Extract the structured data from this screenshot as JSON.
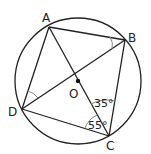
{
  "diagram": {
    "circle": {
      "cx": 78,
      "cy": 81,
      "r": 63
    },
    "points": {
      "A": {
        "label": "A",
        "x": 49,
        "y": 27
      },
      "B": {
        "label": "B",
        "x": 125,
        "y": 40
      },
      "C": {
        "label": "C",
        "x": 109,
        "y": 136
      },
      "D": {
        "label": "D",
        "x": 22,
        "y": 109
      },
      "O": {
        "label": "O",
        "x": 78,
        "y": 82
      }
    },
    "segments": [
      "AB",
      "BC",
      "CD",
      "DA",
      "AC",
      "BD"
    ],
    "angles": [
      {
        "at": "C",
        "between": "BC-OC",
        "label": "35°"
      },
      {
        "at": "C",
        "between": "OC-DC",
        "label": "55°"
      },
      {
        "at": "B",
        "between": "AB-DB",
        "label": ""
      },
      {
        "at": "D",
        "between": "AD-BD",
        "label": ""
      }
    ],
    "stroke_color": "#222222"
  }
}
